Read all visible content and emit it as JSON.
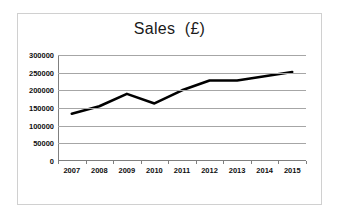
{
  "chart_data": {
    "type": "line",
    "title": "Sales  (£)",
    "xlabel": "",
    "ylabel": "",
    "categories": [
      "2007",
      "2008",
      "2009",
      "2010",
      "2011",
      "2012",
      "2013",
      "2014",
      "2015"
    ],
    "values": [
      134000,
      155000,
      190000,
      163000,
      200000,
      228000,
      228000,
      240000,
      252000
    ],
    "series": [
      {
        "name": "Sales",
        "values": [
          134000,
          155000,
          190000,
          163000,
          200000,
          228000,
          228000,
          240000,
          252000
        ]
      }
    ],
    "ylim": [
      0,
      300000
    ],
    "ytick_labels": [
      "300000",
      "250000",
      "200000",
      "150000",
      "100000",
      "50000",
      "0"
    ],
    "ytick_values": [
      300000,
      250000,
      200000,
      150000,
      100000,
      50000,
      0
    ],
    "grid": true,
    "legend": false,
    "legend_position": "none",
    "line_color": "#000000",
    "grid_color": "#a6a6a6",
    "plot_background": "#ffffff",
    "border_color": "#d0d0d0"
  }
}
